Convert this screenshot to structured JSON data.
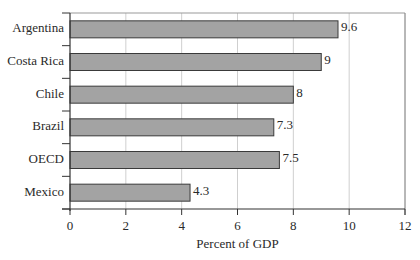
{
  "chart_data": {
    "type": "bar",
    "orientation": "horizontal",
    "title": "",
    "categories": [
      "Argentina",
      "Costa Rica",
      "Chile",
      "Brazil",
      "OECD",
      "Mexico"
    ],
    "values": [
      9.6,
      9,
      8,
      7.3,
      7.5,
      4.3
    ],
    "value_labels": [
      "9.6",
      "9",
      "8",
      "7.3",
      "7.5",
      "4.3"
    ],
    "xlabel": "Percent of GDP",
    "ylabel": "",
    "xlim": [
      0,
      12
    ],
    "xticks": [
      0,
      2,
      4,
      6,
      8,
      10,
      12
    ],
    "xtick_labels": [
      "0",
      "2",
      "4",
      "6",
      "8",
      "10",
      "12"
    ],
    "grid": "vertical",
    "legend": "none",
    "colors": {
      "bar_fill": "#a3a3a3",
      "bar_border": "#3a3a3a",
      "grid": "#cfcfcf",
      "axis": "#333333"
    }
  }
}
